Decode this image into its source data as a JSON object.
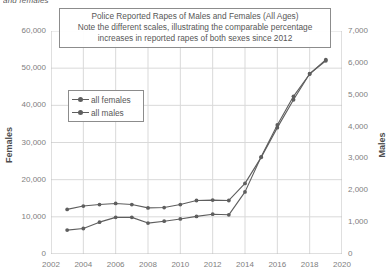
{
  "clipped_header_text": "and females",
  "chart_data": {
    "type": "line",
    "title": "Police Reported Rapes of Males and Females (All Ages)",
    "title_lines": [
      "Police Reported Rapes of Males and Females (All Ages)",
      "Note the different scales, illustrating the comparable percentage",
      "increases in reported rapes of both sexes since 2012"
    ],
    "xlabel": "",
    "ylabel": "Females",
    "y2label": "Males",
    "xlim": [
      2002,
      2020
    ],
    "ylim": [
      0,
      60000
    ],
    "y2lim": [
      0,
      7000
    ],
    "xticks": [
      2002,
      2004,
      2006,
      2008,
      2010,
      2012,
      2014,
      2016,
      2018,
      2020
    ],
    "xtick_labels": [
      "2002",
      "2004",
      "2006",
      "2008",
      "2010",
      "2012",
      "2014",
      "2016",
      "2018",
      "2020"
    ],
    "yticks": [
      0,
      10000,
      20000,
      30000,
      40000,
      50000,
      60000
    ],
    "ytick_labels": [
      "0",
      "10,000",
      "20,000",
      "30,000",
      "40,000",
      "50,000",
      "60,000"
    ],
    "y2ticks": [
      0,
      1000,
      2000,
      3000,
      4000,
      5000,
      6000,
      7000
    ],
    "y2tick_labels": [
      "0",
      "1,000",
      "2,000",
      "3,000",
      "4,000",
      "5,000",
      "6,000",
      "7,000"
    ],
    "grid": true,
    "legend_position": "upper-left-inside",
    "x": [
      2003,
      2004,
      2005,
      2006,
      2007,
      2008,
      2009,
      2010,
      2011,
      2012,
      2013,
      2014,
      2015,
      2016,
      2017,
      2018,
      2019
    ],
    "series": [
      {
        "name": "all females",
        "axis": "left",
        "color": "#5e5e5e",
        "marker": "circle",
        "values": [
          12000,
          12900,
          13300,
          13600,
          13300,
          12400,
          12500,
          13300,
          14400,
          14500,
          14400,
          19000,
          26000,
          34000,
          41500,
          48500,
          52000
        ]
      },
      {
        "name": "all males",
        "axis": "right",
        "color": "#5e5e5e",
        "marker": "circle",
        "values": [
          750,
          800,
          1000,
          1150,
          1150,
          970,
          1030,
          1100,
          1180,
          1250,
          1230,
          1950,
          3050,
          4050,
          4950,
          5650,
          6100
        ]
      }
    ],
    "legend_entries": [
      "all females",
      "all males"
    ],
    "colors": {
      "series_line": "#5e5e5e",
      "grid": "#d9d9d9",
      "axis": "#bfbfbf",
      "tick_text": "#808080",
      "title_text": "#575757",
      "box_border": "#8c8c8c"
    }
  }
}
